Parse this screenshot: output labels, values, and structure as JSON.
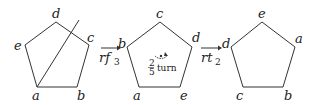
{
  "diagram": {
    "pentagon1": {
      "labels": {
        "top": "d",
        "right": "c",
        "bottom_right": "b",
        "bottom_left": "a",
        "left": "e"
      },
      "has_reflection_line": true
    },
    "arrow1": {
      "op": "rf",
      "sub": "3"
    },
    "pentagon2": {
      "labels": {
        "top": "c",
        "right": "d",
        "bottom_right": "e",
        "bottom_left": "a",
        "left": "b"
      },
      "rotation_note": {
        "num": "2",
        "den": "5",
        "text": "turn"
      }
    },
    "arrow2": {
      "op": "rt",
      "sub": "2"
    },
    "pentagon3": {
      "labels": {
        "top": "e",
        "right": "a",
        "bottom_right": "b",
        "bottom_left": "c",
        "left": "d"
      }
    }
  }
}
